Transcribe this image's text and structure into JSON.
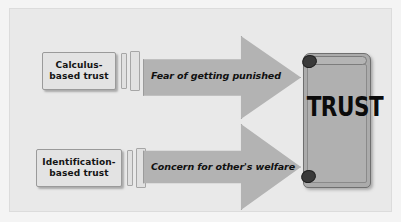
{
  "diagram": {
    "colors": {
      "page_background": "#f4f4f4",
      "panel_background": "#e9e9e9",
      "box_fill": "#e3e3e3",
      "box_border": "#9a9a9a",
      "arrow_fill": "#b3b3b3",
      "arrow_border": "#9b9b9b",
      "scroll_fill": "#ababab",
      "scroll_border": "#6f6f6f",
      "curl_fill": "#3a3a3a",
      "text": "#101010"
    },
    "sources": [
      {
        "id": "calculus-based-trust",
        "line1": "Calculus-",
        "line2": "based trust"
      },
      {
        "id": "identification-based-trust",
        "line1": "Identification-",
        "line2": "based trust"
      }
    ],
    "arrows": [
      {
        "id": "arrow-fear",
        "label": "Fear of getting punished"
      },
      {
        "id": "arrow-concern",
        "label": "Concern for other's welfare"
      }
    ],
    "outcome": {
      "id": "trust-scroll",
      "label": "TRUST"
    }
  }
}
